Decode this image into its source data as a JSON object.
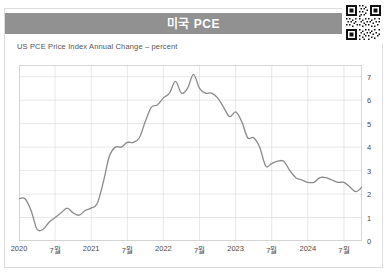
{
  "header": {
    "title": "미국 PCE",
    "bar_color": "#919191",
    "title_color": "#ffffff"
  },
  "qr": {
    "icon": "qr-code-icon"
  },
  "chart_data": {
    "type": "line",
    "title": "미국 PCE",
    "subtitle": "US PCE Price Index Annual Change – percent",
    "xlabel": "",
    "ylabel": "percent",
    "ylim": [
      0,
      7.5
    ],
    "yticks": [
      0,
      1,
      2,
      3,
      4,
      5,
      6,
      7
    ],
    "ytick_labels": [
      "0",
      "1",
      "2",
      "3",
      "4",
      "5",
      "6",
      "7"
    ],
    "y_axis_position": "right",
    "grid": true,
    "legend": null,
    "line_color": "#8a8a8a",
    "xtick_labels": [
      "2020",
      "7월",
      "2021",
      "7월",
      "2022",
      "7월",
      "2023",
      "7월",
      "2024",
      "7월"
    ],
    "xtick_x": [
      0,
      6,
      12,
      18,
      24,
      30,
      36,
      42,
      48,
      54
    ],
    "x": [
      0,
      1,
      2,
      3,
      4,
      5,
      6,
      7,
      8,
      9,
      10,
      11,
      12,
      13,
      14,
      15,
      16,
      17,
      18,
      19,
      20,
      21,
      22,
      23,
      24,
      25,
      26,
      27,
      28,
      29,
      30,
      31,
      32,
      33,
      34,
      35,
      36,
      37,
      38,
      39,
      40,
      41,
      42,
      43,
      44,
      45,
      46,
      47,
      48,
      49,
      50,
      51,
      52,
      53,
      54,
      55,
      56,
      57
    ],
    "x_labels": [
      "2020-01",
      "2020-02",
      "2020-03",
      "2020-04",
      "2020-05",
      "2020-06",
      "2020-07",
      "2020-08",
      "2020-09",
      "2020-10",
      "2020-11",
      "2020-12",
      "2021-01",
      "2021-02",
      "2021-03",
      "2021-04",
      "2021-05",
      "2021-06",
      "2021-07",
      "2021-08",
      "2021-09",
      "2021-10",
      "2021-11",
      "2021-12",
      "2022-01",
      "2022-02",
      "2022-03",
      "2022-04",
      "2022-05",
      "2022-06",
      "2022-07",
      "2022-08",
      "2022-09",
      "2022-10",
      "2022-11",
      "2022-12",
      "2023-01",
      "2023-02",
      "2023-03",
      "2023-04",
      "2023-05",
      "2023-06",
      "2023-07",
      "2023-08",
      "2023-09",
      "2023-10",
      "2023-11",
      "2023-12",
      "2024-01",
      "2024-02",
      "2024-03",
      "2024-04",
      "2024-05",
      "2024-06",
      "2024-07",
      "2024-08",
      "2024-09",
      "2024-10"
    ],
    "values": [
      1.8,
      1.8,
      1.3,
      0.5,
      0.5,
      0.8,
      1.0,
      1.2,
      1.4,
      1.2,
      1.1,
      1.3,
      1.4,
      1.6,
      2.5,
      3.6,
      4.0,
      4.0,
      4.2,
      4.2,
      4.4,
      5.1,
      5.7,
      5.8,
      6.1,
      6.3,
      6.8,
      6.3,
      6.5,
      7.1,
      6.5,
      6.3,
      6.3,
      6.1,
      5.7,
      5.3,
      5.5,
      5.1,
      4.4,
      4.4,
      4.0,
      3.2,
      3.3,
      3.4,
      3.4,
      3.0,
      2.7,
      2.6,
      2.5,
      2.5,
      2.7,
      2.7,
      2.6,
      2.5,
      2.5,
      2.3,
      2.1,
      2.3
    ],
    "series": [
      {
        "name": "US PCE Price Index Annual Change",
        "color": "#8a8a8a",
        "values": [
          1.8,
          1.8,
          1.3,
          0.5,
          0.5,
          0.8,
          1.0,
          1.2,
          1.4,
          1.2,
          1.1,
          1.3,
          1.4,
          1.6,
          2.5,
          3.6,
          4.0,
          4.0,
          4.2,
          4.2,
          4.4,
          5.1,
          5.7,
          5.8,
          6.1,
          6.3,
          6.8,
          6.3,
          6.5,
          7.1,
          6.5,
          6.3,
          6.3,
          6.1,
          5.7,
          5.3,
          5.5,
          5.1,
          4.4,
          4.4,
          4.0,
          3.2,
          3.3,
          3.4,
          3.4,
          3.0,
          2.7,
          2.6,
          2.5,
          2.5,
          2.7,
          2.7,
          2.6,
          2.5,
          2.5,
          2.3,
          2.1,
          2.3
        ]
      }
    ]
  }
}
